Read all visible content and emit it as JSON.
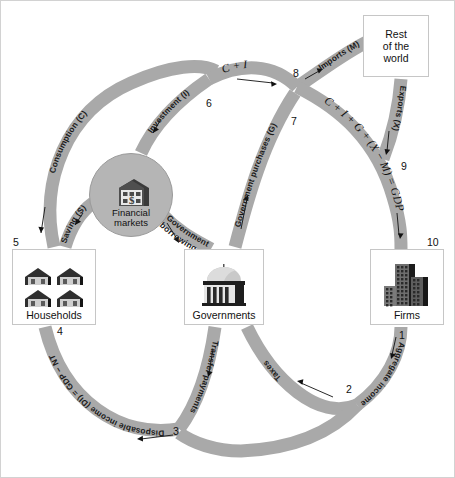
{
  "figure": {
    "background_color": "#ffffff",
    "band_color": "#a9a9a9",
    "border_color": "#d2d2d2"
  },
  "entities": {
    "households": {
      "label": "Households",
      "icon": "houses-icon"
    },
    "governments": {
      "label": "Governments",
      "icon": "capitol-building-icon"
    },
    "firms": {
      "label": "Firms",
      "icon": "office-buildings-icon"
    },
    "rest_of_world": {
      "label": "Rest\nof the\nworld",
      "line1": "Rest",
      "line2": "of the",
      "line3": "world",
      "icon": "none"
    },
    "financial_markets": {
      "label": "Financial\nmarkets",
      "line1": "Financial",
      "line2": "markets",
      "icon": "bank-dollar-icon"
    }
  },
  "flows": [
    {
      "id": "consumption",
      "label": "Consumption (C)",
      "from": "households",
      "to": "junction-6"
    },
    {
      "id": "saving",
      "label": "Saving (S)",
      "from": "households",
      "to": "financial_markets"
    },
    {
      "id": "investment",
      "label": "Investment (I)",
      "from": "financial_markets",
      "to": "junction-6"
    },
    {
      "id": "government-borrowing",
      "label": "Government\nborrowing",
      "line1": "Government",
      "line2": "borrowing",
      "from": "financial_markets",
      "to": "governments"
    },
    {
      "id": "government-purchases",
      "label": "Government purchases (G)",
      "from": "governments",
      "to": "junction-7"
    },
    {
      "id": "c-plus-i",
      "label": "C + I",
      "from": "junction-6",
      "to": "junction-7"
    },
    {
      "id": "imports",
      "label": "Imports (M)",
      "from": "junction-8",
      "to": "rest_of_world"
    },
    {
      "id": "exports",
      "label": "Exports (X)",
      "from": "rest_of_world",
      "to": "junction-9"
    },
    {
      "id": "gdp-expenditure",
      "label": "C + I + G + (X − M) = GDP",
      "from": "junction-7",
      "to": "firms"
    },
    {
      "id": "aggregate-income",
      "label": "Aggregate income = GDP",
      "from": "firms",
      "to": "junction-2"
    },
    {
      "id": "taxes",
      "label": "Taxes",
      "from": "junction-2",
      "to": "governments"
    },
    {
      "id": "transfer-payments",
      "label": "Transfer payments",
      "from": "governments",
      "to": "junction-3"
    },
    {
      "id": "disposable-income",
      "label": "Disposable income (DI) = GDP − NT",
      "from": "junction-3",
      "to": "households"
    }
  ],
  "numbers": [
    {
      "n": "1",
      "x": 398,
      "y": 334
    },
    {
      "n": "2",
      "x": 345,
      "y": 389
    },
    {
      "n": "3",
      "x": 172,
      "y": 430
    },
    {
      "n": "4",
      "x": 56,
      "y": 330
    },
    {
      "n": "5",
      "x": 12,
      "y": 241
    },
    {
      "n": "6",
      "x": 205,
      "y": 102
    },
    {
      "n": "7",
      "x": 290,
      "y": 120
    },
    {
      "n": "8",
      "x": 292,
      "y": 72
    },
    {
      "n": "9",
      "x": 400,
      "y": 165
    },
    {
      "n": "10",
      "x": 428,
      "y": 241
    }
  ]
}
